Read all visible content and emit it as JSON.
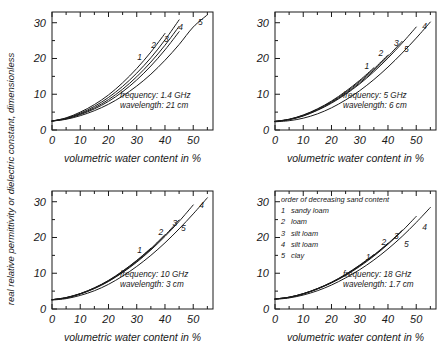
{
  "figure": {
    "shared_ylabel": "real relative permittivity or dielectric constant, dimensionless",
    "shared_xlabel": "volumetric water content in %"
  },
  "legend": {
    "header": "order of decreasing sand content",
    "entries": [
      {
        "key": "1",
        "label": "sandy loam"
      },
      {
        "key": "2",
        "label": "loam"
      },
      {
        "key": "3",
        "label": "silt loam"
      },
      {
        "key": "4",
        "label": "silt loam"
      },
      {
        "key": "5",
        "label": "clay"
      }
    ]
  },
  "chart_data": [
    {
      "type": "line",
      "panel": "top-left",
      "title": "",
      "xlabel": "volumetric water content in %",
      "ylabel": "real relative permittivity or dielectric constant, dimensionless",
      "xlim": [
        0,
        57
      ],
      "ylim": [
        0,
        33
      ],
      "xticks": [
        0,
        10,
        20,
        30,
        40,
        50
      ],
      "yticks": [
        0,
        10,
        20,
        30
      ],
      "xminor_step": 5,
      "grid": false,
      "legend_position": "none",
      "annotations": [
        "frequency: 1.4 GHz",
        "wavelength: 21 cm"
      ],
      "frequency_ghz": 1.4,
      "wavelength": "21 cm",
      "x": [
        0,
        5,
        10,
        15,
        20,
        25,
        30,
        35,
        40,
        45,
        50,
        55
      ],
      "series": [
        {
          "name": "1",
          "label": "sandy loam",
          "values": [
            2.5,
            3.4,
            5.0,
            7.1,
            9.8,
            13.2,
            17.2,
            21.8,
            27.0,
            null,
            null,
            null
          ],
          "end_label_x": 31,
          "end_label_y": 19.5
        },
        {
          "name": "2",
          "label": "loam",
          "values": [
            2.5,
            3.3,
            4.7,
            6.6,
            9.1,
            12.2,
            15.9,
            20.2,
            25.2,
            30.8,
            null,
            null
          ],
          "end_label_x": 36,
          "end_label_y": 22.8
        },
        {
          "name": "3",
          "label": "silt loam",
          "values": [
            2.5,
            3.2,
            4.5,
            6.2,
            8.5,
            11.4,
            14.9,
            19.0,
            23.7,
            29.0,
            null,
            null
          ],
          "end_label_x": 40.5,
          "end_label_y": 24.7
        },
        {
          "name": "4",
          "label": "silt loam",
          "values": [
            2.5,
            3.1,
            4.3,
            5.9,
            8.0,
            10.7,
            14.0,
            17.9,
            22.4,
            27.5,
            33.2,
            null
          ],
          "end_label_x": 45.5,
          "end_label_y": 28.0
        },
        {
          "name": "5",
          "label": "clay",
          "values": [
            2.5,
            3.0,
            4.0,
            5.4,
            7.2,
            9.5,
            12.3,
            15.6,
            19.5,
            23.9,
            28.8,
            32.2
          ],
          "end_label_x": 52.5,
          "end_label_y": 29.5
        }
      ]
    },
    {
      "type": "line",
      "panel": "top-right",
      "title": "",
      "xlabel": "volumetric water content in %",
      "ylabel": "real relative permittivity or dielectric constant, dimensionless",
      "xlim": [
        0,
        57
      ],
      "ylim": [
        0,
        33
      ],
      "xticks": [
        0,
        10,
        20,
        30,
        40,
        50
      ],
      "yticks": [
        0,
        10,
        20,
        30
      ],
      "xminor_step": 5,
      "grid": false,
      "legend_position": "none",
      "annotations": [
        "frequency: 5 GHz",
        "wavelength: 6 cm"
      ],
      "frequency_ghz": 5,
      "wavelength": "6 cm",
      "x": [
        0,
        5,
        10,
        15,
        20,
        25,
        30,
        35,
        40,
        45,
        50,
        55
      ],
      "series": [
        {
          "name": "1",
          "label": "sandy loam",
          "values": [
            2.4,
            3.0,
            4.2,
            5.9,
            8.1,
            10.8,
            13.9,
            17.4,
            null,
            null,
            null,
            null
          ],
          "end_label_x": 32.5,
          "end_label_y": 17.0
        },
        {
          "name": "2",
          "label": "loam",
          "values": [
            2.4,
            3.0,
            4.1,
            5.8,
            7.9,
            10.5,
            13.6,
            17.1,
            21.0,
            null,
            null,
            null
          ],
          "end_label_x": 37.5,
          "end_label_y": 20.8
        },
        {
          "name": "3",
          "label": "silt loam",
          "values": [
            2.4,
            2.9,
            4.0,
            5.6,
            7.7,
            10.2,
            13.2,
            16.7,
            20.6,
            24.8,
            null,
            null
          ],
          "end_label_x": 43,
          "end_label_y": 23.6
        },
        {
          "name": "4",
          "label": "silt loam",
          "values": [
            2.4,
            2.9,
            3.9,
            5.5,
            7.5,
            10.0,
            12.9,
            16.3,
            20.1,
            24.3,
            28.8,
            null
          ],
          "end_label_x": 53,
          "end_label_y": 28.3
        },
        {
          "name": "5",
          "label": "clay",
          "values": [
            2.3,
            2.6,
            3.3,
            4.5,
            6.2,
            8.4,
            11.0,
            14.1,
            17.6,
            21.5,
            25.7,
            30.2
          ],
          "end_label_x": 46.5,
          "end_label_y": 21.8
        }
      ]
    },
    {
      "type": "line",
      "panel": "bottom-left",
      "title": "",
      "xlabel": "volumetric water content in %",
      "ylabel": "real relative permittivity or dielectric constant, dimensionless",
      "xlim": [
        0,
        57
      ],
      "ylim": [
        0,
        33
      ],
      "xticks": [
        0,
        10,
        20,
        30,
        40,
        50
      ],
      "yticks": [
        0,
        10,
        20,
        30
      ],
      "xminor_step": 5,
      "grid": false,
      "legend_position": "none",
      "annotations": [
        "frequency: 10 GHz",
        "wavelength: 3 cm"
      ],
      "frequency_ghz": 10,
      "wavelength": "3 cm",
      "x": [
        0,
        5,
        10,
        15,
        20,
        25,
        30,
        35,
        40,
        45,
        50,
        55
      ],
      "series": [
        {
          "name": "1",
          "label": "sandy loam",
          "values": [
            2.6,
            3.2,
            4.3,
            5.9,
            8.0,
            10.6,
            13.6,
            17.0,
            null,
            null,
            null,
            null
          ],
          "end_label_x": 31,
          "end_label_y": 15.6
        },
        {
          "name": "2",
          "label": "loam",
          "values": [
            2.6,
            3.2,
            4.3,
            5.9,
            7.9,
            10.5,
            13.5,
            16.9,
            20.8,
            null,
            null,
            null
          ],
          "end_label_x": 38.5,
          "end_label_y": 20.6
        },
        {
          "name": "3",
          "label": "silt loam",
          "values": [
            2.6,
            3.1,
            4.2,
            5.8,
            7.8,
            10.3,
            13.3,
            16.7,
            20.6,
            24.9,
            null,
            null
          ],
          "end_label_x": 43.5,
          "end_label_y": 23.3
        },
        {
          "name": "4",
          "label": "silt loam",
          "values": [
            2.6,
            3.1,
            4.2,
            5.7,
            7.7,
            10.2,
            13.1,
            16.5,
            20.3,
            24.5,
            29.1,
            null
          ],
          "end_label_x": 53,
          "end_label_y": 28.3
        },
        {
          "name": "5",
          "label": "clay",
          "values": [
            2.5,
            2.9,
            3.8,
            5.1,
            6.9,
            9.2,
            11.9,
            15.0,
            18.5,
            22.4,
            26.6,
            31.1
          ],
          "end_label_x": 46.5,
          "end_label_y": 21.7
        }
      ]
    },
    {
      "type": "line",
      "panel": "bottom-right",
      "title": "",
      "xlabel": "volumetric water content in %",
      "ylabel": "real relative permittivity or dielectric constant, dimensionless",
      "xlim": [
        0,
        57
      ],
      "ylim": [
        0,
        33
      ],
      "xticks": [
        0,
        10,
        20,
        30,
        40,
        50
      ],
      "yticks": [
        0,
        10,
        20,
        30
      ],
      "xminor_step": 5,
      "grid": false,
      "legend_position": "top-left",
      "annotations": [
        "frequency: 18 GHz",
        "wavelength: 1.7 cm"
      ],
      "frequency_ghz": 18,
      "wavelength": "1.7 cm",
      "x": [
        0,
        5,
        10,
        15,
        20,
        25,
        30,
        35,
        40,
        45,
        50,
        55
      ],
      "series": [
        {
          "name": "1",
          "label": "sandy loam",
          "values": [
            2.8,
            3.3,
            4.3,
            5.7,
            7.5,
            9.7,
            12.3,
            15.2,
            null,
            null,
            null,
            null
          ],
          "end_label_x": 33,
          "end_label_y": 13.8
        },
        {
          "name": "2",
          "label": "loam",
          "values": [
            2.8,
            3.3,
            4.3,
            5.7,
            7.4,
            9.6,
            12.2,
            15.1,
            18.4,
            null,
            null,
            null
          ],
          "end_label_x": 38.5,
          "end_label_y": 17.8
        },
        {
          "name": "3",
          "label": "silt loam",
          "values": [
            2.8,
            3.3,
            4.2,
            5.6,
            7.4,
            9.5,
            12.1,
            15.0,
            18.3,
            22.0,
            null,
            null
          ],
          "end_label_x": 43,
          "end_label_y": 19.6
        },
        {
          "name": "4",
          "label": "silt loam",
          "values": [
            2.8,
            3.2,
            4.2,
            5.6,
            7.3,
            9.4,
            11.9,
            14.8,
            18.1,
            21.8,
            25.9,
            null
          ],
          "end_label_x": 53,
          "end_label_y": 22.2
        },
        {
          "name": "5",
          "label": "clay",
          "values": [
            2.7,
            3.1,
            3.9,
            5.1,
            6.7,
            8.7,
            11.0,
            13.7,
            16.8,
            20.3,
            24.2,
            28.4
          ],
          "end_label_x": 46.5,
          "end_label_y": 17.2
        }
      ]
    }
  ]
}
